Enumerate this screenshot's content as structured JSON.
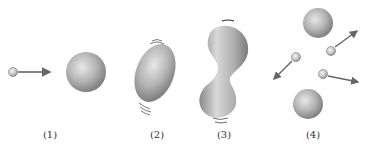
{
  "diagram": {
    "type": "process-sequence",
    "stages": [
      {
        "label": "(1)",
        "description": "small particle with arrow moving toward large sphere"
      },
      {
        "label": "(2)",
        "description": "sphere deformed into tilted ellipsoid, vibration marks"
      },
      {
        "label": "(3)",
        "description": "elongated dumbbell shape with narrow neck, vibration marks"
      },
      {
        "label": "(4)",
        "description": "two spheres separated, three small particles moving outward with arrows"
      }
    ]
  },
  "colors": {
    "sphere_light": "#e6e6e6",
    "sphere_mid": "#b0b0b0",
    "sphere_dark": "#7a7a7a",
    "arrow": "#666666",
    "label": "#333333"
  }
}
